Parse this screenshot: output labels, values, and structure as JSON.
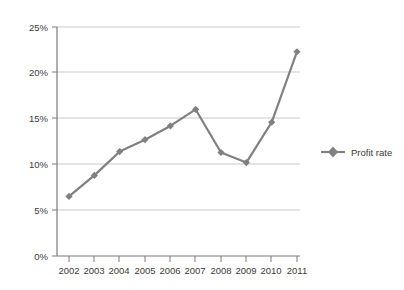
{
  "chart_data": {
    "type": "line",
    "title": "",
    "xlabel": "",
    "ylabel": "",
    "categories": [
      "2002",
      "2003",
      "2004",
      "2005",
      "2006",
      "2007",
      "2008",
      "2009",
      "2010",
      "2011"
    ],
    "series": [
      {
        "name": "Profit rate",
        "values": [
          6.5,
          8.8,
          11.4,
          12.7,
          14.2,
          16.0,
          11.3,
          10.2,
          14.6,
          22.3
        ]
      }
    ],
    "ylim": [
      0,
      25
    ],
    "yticks": [
      0,
      5,
      10,
      15,
      20,
      25
    ],
    "ytick_labels": [
      "0%",
      "5%",
      "10%",
      "15%",
      "20%",
      "25%"
    ],
    "xtick_labels": [
      "2002",
      "2003",
      "2004",
      "2005",
      "2006",
      "2007",
      "2008",
      "2009",
      "2010",
      "2011"
    ],
    "grid": true,
    "grid_axis": "y",
    "legend": {
      "position": "right",
      "entries": [
        "Profit rate"
      ]
    },
    "colors": {
      "series": "#808080",
      "grid": "#c9c9c9",
      "axis": "#808080",
      "text": "#3a3a3a",
      "background": "#ffffff"
    },
    "marker": "diamond"
  },
  "legend": {
    "label": "Profit rate"
  },
  "axes": {
    "y_labels": [
      "25%",
      "20%",
      "15%",
      "10%",
      "5%",
      "0%"
    ],
    "x_labels": [
      "2002",
      "2003",
      "2004",
      "2005",
      "2006",
      "2007",
      "2008",
      "2009",
      "2010",
      "2011"
    ]
  }
}
